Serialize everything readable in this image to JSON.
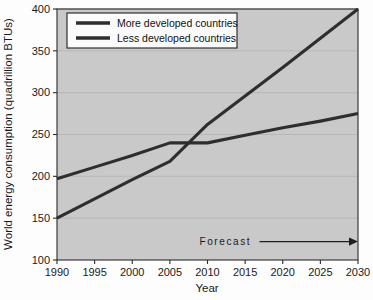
{
  "chart_data": {
    "type": "line",
    "title": "",
    "xlabel": "Year",
    "ylabel": "World energy consumption (quadrillion BTUs)",
    "xlim": [
      1990,
      2030
    ],
    "ylim": [
      100,
      400
    ],
    "xticks": [
      1990,
      1995,
      2000,
      2005,
      2010,
      2015,
      2020,
      2025,
      2030
    ],
    "yticks": [
      100,
      150,
      200,
      250,
      300,
      350,
      400
    ],
    "xtick_labels": [
      "1990",
      "1995",
      "2000",
      "2005",
      "2010",
      "2015",
      "2020",
      "2025",
      "2030"
    ],
    "ytick_labels": [
      "100",
      "150",
      "200",
      "250",
      "300",
      "350",
      "400"
    ],
    "grid": true,
    "grid_axis": "y",
    "legend_position": "upper-left-inside",
    "x": [
      1990,
      1995,
      2000,
      2005,
      2010,
      2015,
      2020,
      2025,
      2030
    ],
    "series": [
      {
        "name": "More developed countries",
        "color": "#2e2e2e",
        "values": [
          197,
          211,
          225,
          240,
          240,
          249,
          258,
          266,
          275
        ]
      },
      {
        "name": "Less developed countries",
        "color": "#2e2e2e",
        "values": [
          150,
          173,
          196,
          218,
          262,
          296,
          330,
          365,
          400
        ]
      }
    ],
    "annotations": [
      {
        "name": "forecast-marker",
        "text": "Forecast",
        "x_start": 2010,
        "x_end": 2030,
        "y": 122,
        "style": "arrow-right"
      }
    ],
    "colors": {
      "plot_background": "#c9c9c9",
      "page_background": "#fdfdfd",
      "line": "#2e2e2e",
      "axis": "#2b2b2b",
      "gridline": "#b3b3b3",
      "legend_background": "#fbfbfb"
    }
  },
  "legend": {
    "entries": [
      {
        "label": "More developed countries"
      },
      {
        "label": "Less developed countries"
      }
    ]
  },
  "axes": {
    "x_title": "Year",
    "y_title": "World energy consumption (quadrillion BTUs)"
  },
  "annotation": {
    "forecast_label": "Forecast"
  }
}
